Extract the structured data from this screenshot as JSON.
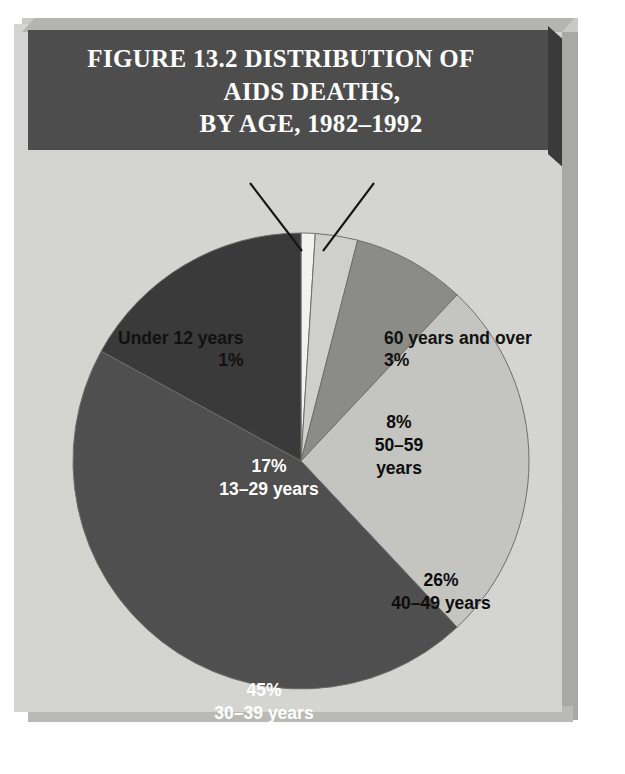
{
  "figure": {
    "title_lines": [
      "FIGURE 13.2  DISTRIBUTION OF",
      "AIDS DEATHS,",
      "BY AGE, 1982–1992"
    ],
    "title_full": "FIGURE 13.2 DISTRIBUTION OF AIDS DEATHS, BY AGE, 1982–1992"
  },
  "callouts": {
    "under12": {
      "category": "Under 12 years",
      "percent": "1%"
    },
    "over60": {
      "category": "60 years and over",
      "percent": "3%"
    }
  },
  "wedge_labels": {
    "w50_59": {
      "percent": "8%",
      "range": "50–59",
      "unit": "years"
    },
    "w40_49": {
      "percent": "26%",
      "category": "40–49 years"
    },
    "w30_39": {
      "percent": "45%",
      "category": "30–39 years"
    },
    "w13_29": {
      "percent": "17%",
      "category": "13–29 years"
    }
  },
  "colors": {
    "panel_face": "#d7d7d4",
    "panel_bevel": "#c9c9c6",
    "panel_shadow": "#a8a8a6",
    "title_bar": "#4d4d4d",
    "title_text": "#ffffff",
    "wedge_under12": "#f2f2ef",
    "wedge_60plus": "#cfcfcb",
    "wedge_50_59": "#8b8b88",
    "wedge_40_49": "#c4c4c0",
    "wedge_30_39": "#4f4f4f",
    "wedge_13_29": "#3a3a3a",
    "pie_outline": "#6e6e6c",
    "leader_line": "#161616"
  },
  "chart_data": {
    "type": "pie",
    "title": "FIGURE 13.2 DISTRIBUTION OF AIDS DEATHS, BY AGE, 1982–1992",
    "xlabel": "",
    "ylabel": "",
    "units": "percent of AIDS deaths",
    "legend": "none (labels placed on/around slices)",
    "start_angle_deg": 0,
    "direction": "clockwise from 12 o'clock",
    "categories": [
      "Under 12 years",
      "60 years and over",
      "50–59 years",
      "40–49 years",
      "30–39 years",
      "13–29 years"
    ],
    "values": [
      1,
      3,
      8,
      26,
      45,
      17
    ],
    "slices": [
      {
        "label": "Under 12 years",
        "value": 1,
        "display": "1%",
        "color": "#f2f2ef",
        "label_placement": "callout-left"
      },
      {
        "label": "60 years and over",
        "value": 3,
        "display": "3%",
        "color": "#cfcfcb",
        "label_placement": "callout-right"
      },
      {
        "label": "50–59 years",
        "value": 8,
        "display": "8%",
        "color": "#8b8b88",
        "label_placement": "inside"
      },
      {
        "label": "40–49 years",
        "value": 26,
        "display": "26%",
        "color": "#c4c4c0",
        "label_placement": "inside"
      },
      {
        "label": "30–39 years",
        "value": 45,
        "display": "45%",
        "color": "#4f4f4f",
        "label_placement": "inside"
      },
      {
        "label": "13–29 years",
        "value": 17,
        "display": "17%",
        "color": "#3a3a3a",
        "label_placement": "inside"
      }
    ],
    "total": 100
  }
}
